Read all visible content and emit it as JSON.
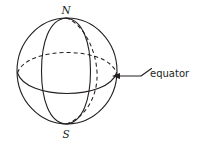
{
  "figure": {
    "background_color": "#ffffff",
    "line_color": "#231f20",
    "labels": {
      "north_pole": "N",
      "south_pole": "S",
      "callout": "equator"
    },
    "geometry": {
      "sphere_center_x": 67,
      "sphere_center_y": 71,
      "sphere_radius_x": 50,
      "sphere_radius_y": 53,
      "north_pole_x": 66,
      "north_pole_y": 18,
      "south_pole_x": 66,
      "south_pole_y": 124,
      "equator_tilt_ry": 16,
      "front_meridian_rx": 16,
      "back_meridian_rx": 20
    },
    "callout_line": {
      "arrow_tip_x": 113,
      "arrow_tip_y": 76,
      "elbow_x": 141,
      "elbow_y": 76,
      "end_x": 151,
      "end_y": 69
    },
    "elements": [
      {
        "name": "sphere-outline",
        "style": "solid"
      },
      {
        "name": "equator-front-arc",
        "style": "solid"
      },
      {
        "name": "equator-back-arc",
        "style": "dashed"
      },
      {
        "name": "front-meridian",
        "style": "solid"
      },
      {
        "name": "back-meridian",
        "style": "dashed"
      }
    ]
  }
}
